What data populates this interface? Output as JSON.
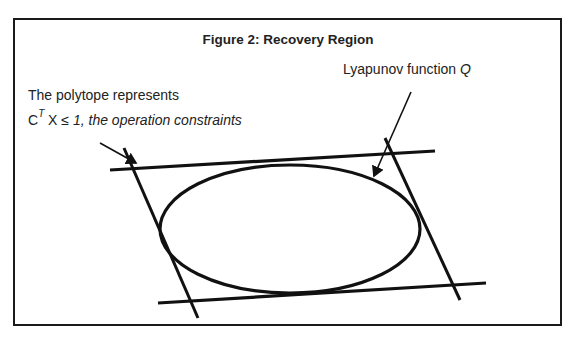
{
  "page": {
    "clipped_top_text": "y                              y,              g",
    "clipped_bottom_text": ""
  },
  "figure": {
    "title": "Figure 2: Recovery Region",
    "labels": {
      "lyapunov_prefix": "Lyapunov function ",
      "lyapunov_symbol": "Q",
      "polytope_line1": "The polytope represents",
      "polytope_c": "C",
      "polytope_sup": "T",
      "polytope_x": " X ",
      "polytope_rest": "≤ 1, the operation constraints"
    },
    "shapes": {
      "ellipse": {
        "cx": 290,
        "cy": 229,
        "rx": 130,
        "ry": 64,
        "label": "Lyapunov function Q"
      },
      "polytope_lines": [
        {
          "name": "top-constraint",
          "x1": 110,
          "y1": 170,
          "x2": 435,
          "y2": 151
        },
        {
          "name": "bottom-constraint",
          "x1": 158,
          "y1": 303,
          "x2": 486,
          "y2": 283
        },
        {
          "name": "left-constraint",
          "x1": 124,
          "y1": 148,
          "x2": 198,
          "y2": 318
        },
        {
          "name": "right-constraint",
          "x1": 385,
          "y1": 138,
          "x2": 460,
          "y2": 300
        }
      ],
      "arrows": [
        {
          "name": "lyapunov-arrow",
          "x1": 411,
          "y1": 92,
          "x2": 374,
          "y2": 176
        },
        {
          "name": "polytope-arrow",
          "x1": 100,
          "y1": 143,
          "x2": 136,
          "y2": 163
        }
      ]
    }
  }
}
